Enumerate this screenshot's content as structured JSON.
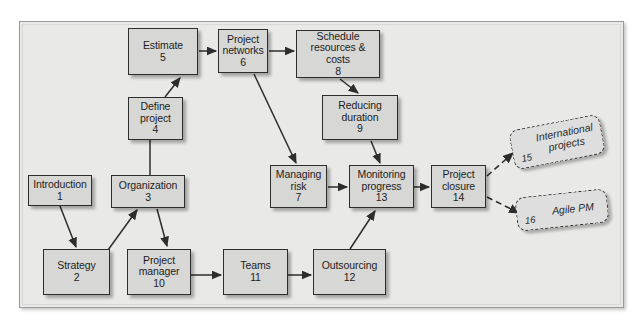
{
  "diagram": {
    "background_color": "#e9e9e7",
    "node_fill": "#d7d7d5",
    "node_border": "#2d2d2d",
    "nodes": [
      {
        "id": "n1",
        "label": "Introduction",
        "number": "1",
        "text": "Introduction\n1"
      },
      {
        "id": "n2",
        "label": "Strategy",
        "number": "2",
        "text": "Strategy\n2"
      },
      {
        "id": "n3",
        "label": "Organization",
        "number": "3",
        "text": "Organization\n3"
      },
      {
        "id": "n4",
        "label": "Define project",
        "number": "4",
        "text": "Define\nproject\n4"
      },
      {
        "id": "n5",
        "label": "Estimate",
        "number": "5",
        "text": "Estimate\n5"
      },
      {
        "id": "n6",
        "label": "Project networks",
        "number": "6",
        "text": "Project\nnetworks\n6"
      },
      {
        "id": "n7",
        "label": "Managing risk",
        "number": "7",
        "text": "Managing\nrisk\n7"
      },
      {
        "id": "n8",
        "label": "Schedule resources & costs",
        "number": "8",
        "text": "Schedule\nresources & costs\n8"
      },
      {
        "id": "n9",
        "label": "Reducing duration",
        "number": "9",
        "text": "Reducing\nduration\n9"
      },
      {
        "id": "n10",
        "label": "Project manager",
        "number": "10",
        "text": "Project\nmanager\n10"
      },
      {
        "id": "n11",
        "label": "Teams",
        "number": "11",
        "text": "Teams\n11"
      },
      {
        "id": "n12",
        "label": "Outsourcing",
        "number": "12",
        "text": "Outsourcing\n12"
      },
      {
        "id": "n13",
        "label": "Monitoring progress",
        "number": "13",
        "text": "Monitoring\nprogress\n13"
      },
      {
        "id": "n14",
        "label": "Project closure",
        "number": "14",
        "text": "Project\nclosure\n14"
      }
    ],
    "callouts": [
      {
        "id": "c15",
        "label": "International projects",
        "number": "15",
        "style": "dashed-rotated"
      },
      {
        "id": "c16",
        "label": "Agile PM",
        "number": "16",
        "style": "dashed-rotated"
      }
    ],
    "connections": [
      {
        "from": "1",
        "to": "2",
        "style": "solid"
      },
      {
        "from": "2",
        "to": "3",
        "style": "solid"
      },
      {
        "from": "3",
        "to": "4",
        "style": "solid"
      },
      {
        "from": "3",
        "to": "10",
        "style": "solid"
      },
      {
        "from": "4",
        "to": "5",
        "style": "solid"
      },
      {
        "from": "5",
        "to": "6",
        "style": "solid"
      },
      {
        "from": "6",
        "to": "8",
        "style": "solid"
      },
      {
        "from": "6",
        "to": "7",
        "style": "solid"
      },
      {
        "from": "8",
        "to": "9",
        "style": "solid"
      },
      {
        "from": "9",
        "to": "13",
        "style": "solid"
      },
      {
        "from": "7",
        "to": "13",
        "style": "solid"
      },
      {
        "from": "10",
        "to": "11",
        "style": "solid"
      },
      {
        "from": "11",
        "to": "12",
        "style": "solid"
      },
      {
        "from": "12",
        "to": "13",
        "style": "solid"
      },
      {
        "from": "13",
        "to": "14",
        "style": "solid"
      },
      {
        "from": "14",
        "to": "15",
        "style": "dashed"
      },
      {
        "from": "14",
        "to": "16",
        "style": "dashed"
      }
    ]
  }
}
